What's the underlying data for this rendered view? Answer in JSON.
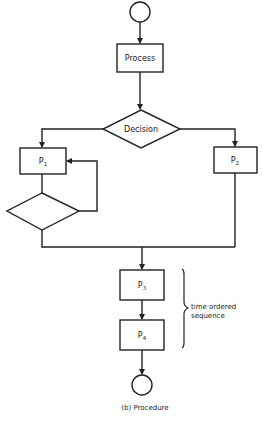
{
  "diagram": {
    "type": "flowchart",
    "caption": "(b) Procedure",
    "colors": {
      "stroke": "#222222",
      "background": "#ffffff"
    },
    "nodes": {
      "start": {
        "shape": "circle"
      },
      "process": {
        "shape": "rectangle",
        "label": "Process"
      },
      "decision": {
        "shape": "diamond",
        "label": "Decision"
      },
      "p1": {
        "shape": "rectangle",
        "label": "P",
        "subscript": "1"
      },
      "p2": {
        "shape": "rectangle",
        "label": "P",
        "subscript": "2"
      },
      "loop_decision": {
        "shape": "diamond",
        "label": ""
      },
      "p3": {
        "shape": "rectangle",
        "label": "P",
        "subscript": "3"
      },
      "p4": {
        "shape": "rectangle",
        "label": "P",
        "subscript": "4"
      },
      "end": {
        "shape": "circle"
      }
    },
    "edges": [
      {
        "from": "start",
        "to": "process"
      },
      {
        "from": "process",
        "to": "decision"
      },
      {
        "from": "decision",
        "to": "p1"
      },
      {
        "from": "decision",
        "to": "p2"
      },
      {
        "from": "p1",
        "to": "loop_decision"
      },
      {
        "from": "loop_decision",
        "to": "p1",
        "note": "loop back"
      },
      {
        "from": "loop_decision",
        "to": "p3"
      },
      {
        "from": "p2",
        "to": "p3"
      },
      {
        "from": "p3",
        "to": "p4"
      },
      {
        "from": "p4",
        "to": "end"
      }
    ],
    "annotation": {
      "line1": "time ordered",
      "line2": "sequence",
      "brace_spans": [
        "p3",
        "p4"
      ]
    }
  }
}
